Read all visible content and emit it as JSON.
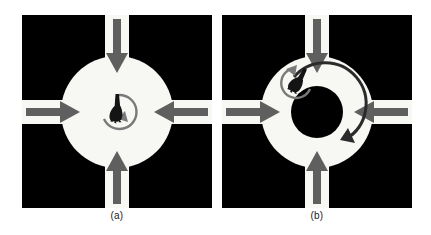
{
  "figure": {
    "background_color": "#ffffff",
    "panel_background_color": "#000000",
    "road_color": "#f7f7f3",
    "arrow_color": "#5f5f5f",
    "vehicle_color": "#141414",
    "rotation_arc_color": "#7a7a7a",
    "circulation_arc_color": "#2b2b2b"
  },
  "panels": [
    {
      "id": "a",
      "caption": "(a)",
      "name": "open-square-intersection",
      "center_shape": "solid-disc",
      "disc_radius": 56,
      "inner_hole_radius": 0,
      "approach_arrows": [
        {
          "name": "north-approach-arrow",
          "direction": "down",
          "label": "north inbound"
        },
        {
          "name": "south-approach-arrow",
          "direction": "up",
          "label": "south inbound"
        },
        {
          "name": "west-approach-arrow",
          "direction": "right",
          "label": "west inbound"
        },
        {
          "name": "east-approach-arrow",
          "direction": "left",
          "label": "east inbound"
        }
      ],
      "vehicle": {
        "name": "vehicle",
        "x": 95,
        "y": 93,
        "rotation_deg": 20
      },
      "rotation_arc": {
        "name": "vehicle-rotation-arc",
        "radius": 17,
        "direction": "clockwise"
      },
      "circulation_arc": null
    },
    {
      "id": "b",
      "caption": "(b)",
      "name": "roundabout-intersection",
      "center_shape": "annulus",
      "disc_radius": 56,
      "inner_hole_radius": 26,
      "approach_arrows": [
        {
          "name": "north-approach-arrow",
          "direction": "down",
          "label": "north inbound"
        },
        {
          "name": "south-approach-arrow",
          "direction": "up",
          "label": "south inbound"
        },
        {
          "name": "west-approach-arrow",
          "direction": "right",
          "label": "west inbound"
        },
        {
          "name": "east-approach-arrow",
          "direction": "left",
          "label": "east inbound"
        }
      ],
      "vehicle": {
        "name": "vehicle",
        "x": 76,
        "y": 68,
        "rotation_deg": 25
      },
      "rotation_arc": {
        "name": "vehicle-rotation-arc",
        "radius": 15,
        "direction": "counter-clockwise"
      },
      "circulation_arc": {
        "name": "circulation-arc",
        "radius": 41,
        "direction": "counter-clockwise"
      }
    }
  ]
}
